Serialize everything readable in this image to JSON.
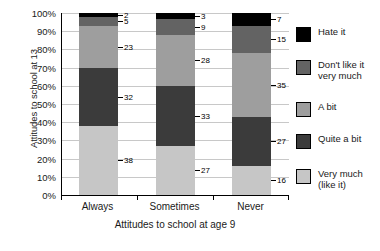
{
  "chart_data": {
    "type": "bar",
    "subtype": "stacked-percentage",
    "title": "",
    "xlabel": "Attitudes to school at age 9",
    "ylabel": "Attitudes to school at 13",
    "categories": [
      "Always",
      "Sometimes",
      "Never"
    ],
    "ylim": [
      0,
      100
    ],
    "ytick_labels": [
      "0%",
      "10%",
      "20%",
      "30%",
      "40%",
      "50%",
      "60%",
      "70%",
      "80%",
      "90%",
      "100%"
    ],
    "ytick_values": [
      0,
      10,
      20,
      30,
      40,
      50,
      60,
      70,
      80,
      90,
      100
    ],
    "grid": true,
    "legend_position": "right",
    "series": [
      {
        "name": "Very much (like it)",
        "color": "#c6c6c6",
        "values": [
          38,
          27,
          16
        ]
      },
      {
        "name": "Quite a bit",
        "color": "#3b3b3b",
        "values": [
          32,
          33,
          27
        ]
      },
      {
        "name": "A bit",
        "color": "#9e9e9e",
        "values": [
          23,
          28,
          35
        ]
      },
      {
        "name": "Don't like it very much",
        "color": "#636363",
        "values": [
          5,
          9,
          15
        ]
      },
      {
        "name": "Hate it",
        "color": "#000000",
        "values": [
          2,
          3,
          7
        ]
      }
    ],
    "legend_entries": [
      {
        "label": "Hate it",
        "color": "#000000"
      },
      {
        "label": "Don't like it\nvery much",
        "color": "#636363"
      },
      {
        "label": "A bit",
        "color": "#9e9e9e"
      },
      {
        "label": "Quite a bit",
        "color": "#3b3b3b"
      },
      {
        "label": "Very much\n(like it)",
        "color": "#c6c6c6"
      }
    ]
  }
}
